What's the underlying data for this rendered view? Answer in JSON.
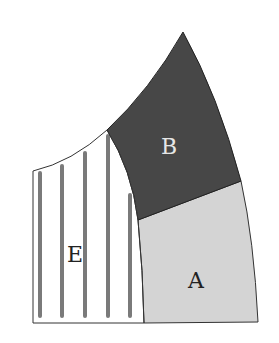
{
  "diagram": {
    "regions": [
      {
        "id": "A",
        "label": "A",
        "fill": "#d4d4d4",
        "label_color": "#222222"
      },
      {
        "id": "B",
        "label": "B",
        "fill": "#474747",
        "label_color": "#e6e6e6"
      },
      {
        "id": "E",
        "label": "E",
        "fill": "#ffffff",
        "pattern": "vertical-stripes",
        "stripe_color": "#7a7a7a",
        "label_color": "#222222"
      }
    ],
    "stroke_color": "#333333"
  }
}
